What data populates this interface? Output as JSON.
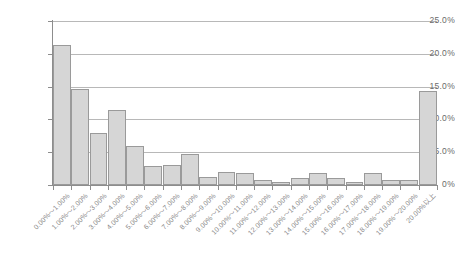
{
  "chart_data": {
    "type": "bar",
    "title": "",
    "subtitle": "",
    "xlabel": "",
    "ylabel": "",
    "grid": true,
    "legend": false,
    "ylim": [
      0,
      25
    ],
    "y_ticks": [
      "0%",
      "5.0%",
      "10.0%",
      "15.0%",
      "20.0%",
      "25.0%"
    ],
    "y_tick_values": [
      0,
      5,
      10,
      15,
      20,
      25
    ],
    "categories": [
      "0.00%～1.00%",
      "1.00%～2.00%",
      "2.00%～3.00%",
      "3.00%～4.00%",
      "4.00%～5.00%",
      "5.00%～6.00%",
      "6.00%～7.00%",
      "7.00%～8.00%",
      "8.00%～9.00%",
      "9.00%～10.00%",
      "10.00%～11.00%",
      "11.00%～12.00%",
      "12.00%～13.00%",
      "13.00%～14.00%",
      "14.00%～15.00%",
      "15.00%～16.00%",
      "16.00%～17.00%",
      "17.00%～18.00%",
      "18.00%～19.00%",
      "19.00%～20.00%",
      "20.00%以上"
    ],
    "values": [
      21.4,
      14.7,
      7.9,
      11.5,
      6.0,
      2.9,
      3.0,
      4.8,
      1.2,
      2.0,
      1.8,
      0.7,
      0.5,
      1.1,
      1.8,
      1.1,
      0.5,
      1.8,
      0.7,
      0.7,
      14.3
    ],
    "colors": {
      "bar_fill": "#d6d6d6",
      "bar_border": "#9a9a9a",
      "gridline": "#b8b8b8",
      "axis": "#8d8d8d",
      "tick_label": "#6a6a6a",
      "x_label": "#8a8a8a",
      "background": "#ffffff"
    }
  }
}
